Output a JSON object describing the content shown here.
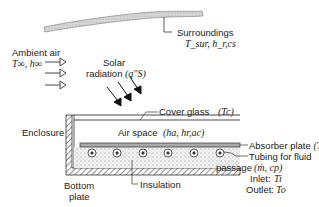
{
  "diagram": {
    "labels": {
      "surroundings": "Surroundings",
      "surroundings_vars": "T_sur, h_r,cs",
      "ambient_air": "Ambient air",
      "ambient_vars": "T∞, h∞",
      "solar_radiation": "Solar",
      "solar_radiation_2": "radiation",
      "solar_var": "(q″S)",
      "cover_glass": "Cover glass",
      "cover_glass_var": "(Tc)",
      "enclosure": "Enclosure",
      "air_space": "Air space",
      "air_space_vars": "(ha, hr,ac)",
      "absorber_plate": "Absorber plate",
      "absorber_vars": "(Ta, α)",
      "tubing_1": "Tubing for fluid",
      "tubing_2": "passage",
      "tubing_vars": "(ṁ, cp)",
      "inlet": "Inlet:",
      "inlet_var": "Ti",
      "outlet": "Outlet:",
      "outlet_var": "To",
      "bottom_plate_1": "Bottom",
      "bottom_plate_2": "plate",
      "insulation": "Insulation"
    },
    "components": [
      "surroundings",
      "ambient-air",
      "solar-radiation",
      "cover-glass",
      "enclosure",
      "air-space",
      "absorber-plate",
      "tubing",
      "insulation",
      "bottom-plate"
    ],
    "tube_count": 6
  }
}
